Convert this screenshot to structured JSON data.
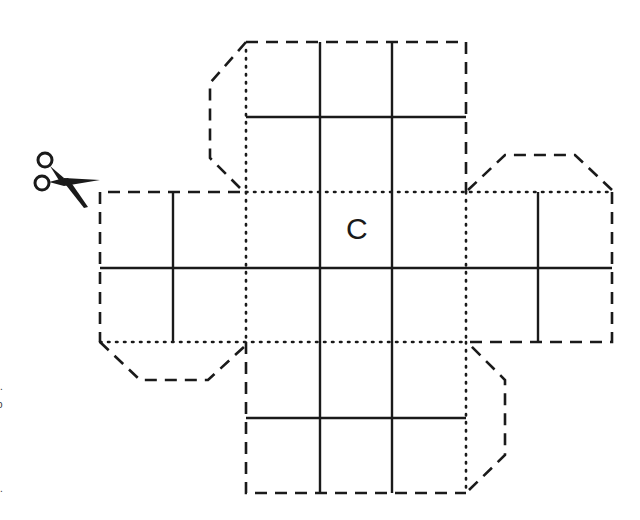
{
  "diagram": {
    "face_label": "C",
    "icons": {
      "scissors": "scissors-icon"
    },
    "line_styles": {
      "cut": "dashed",
      "fold": "dotted",
      "grid": "solid"
    },
    "colors": {
      "ink": "#1a1a1a",
      "background": "#ffffff"
    },
    "edge_marks": [
      ".",
      "o",
      "."
    ]
  }
}
